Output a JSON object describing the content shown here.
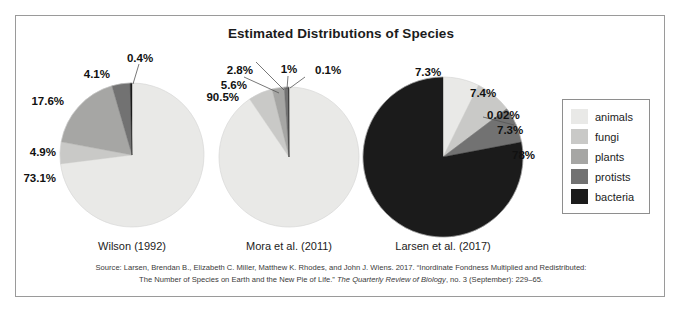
{
  "title": "Estimated Distributions of Species",
  "colors": {
    "animals": "#e9e9e7",
    "fungi": "#c9c9c7",
    "plants": "#a6a6a4",
    "protists": "#727272",
    "bacteria": "#1b1b1b",
    "frame": "#9a9a9a",
    "text": "#1c1c1c"
  },
  "legend": {
    "items": [
      {
        "label": "animals",
        "color": "#e9e9e7"
      },
      {
        "label": "fungi",
        "color": "#c9c9c7"
      },
      {
        "label": "plants",
        "color": "#a6a6a4"
      },
      {
        "label": "protists",
        "color": "#727272"
      },
      {
        "label": "bacteria",
        "color": "#1b1b1b"
      }
    ]
  },
  "source": {
    "line1_a": "Source: Larsen, Brendan B., Elizabeth C. Miller, Matthew K. Rhodes, and John J. Wiens. 2017. “Inordinate Fondness Multiplied and Redistributed:",
    "line2_a": "The Number of Species on Earth and the New Pie of Life.” ",
    "line2_ital": "The Quarterly Review of Biology",
    "line2_b": ", no. 3 (September): 229–65."
  },
  "chart_data": {
    "type": "pie",
    "title": "Estimated Distributions of Species",
    "categories": [
      "animals",
      "fungi",
      "plants",
      "protists",
      "bacteria"
    ],
    "legend_position": "right",
    "charts": [
      {
        "name": "Wilson (1992)",
        "caption": "Wilson (1992)",
        "values": [
          73.1,
          4.9,
          17.6,
          4.1,
          0.4
        ],
        "labels": [
          "73.1%",
          "4.9%",
          "17.6%",
          "4.1%",
          "0.4%"
        ]
      },
      {
        "name": "Mora et al. (2011)",
        "caption": "Mora et al. (2011)",
        "values": [
          90.5,
          5.6,
          2.8,
          1.0,
          0.1
        ],
        "labels": [
          "90.5%",
          "5.6%",
          "2.8%",
          "1%",
          "0.1%"
        ]
      },
      {
        "name": "Larsen et al. (2017)",
        "caption": "Larsen et al. (2017)",
        "values": [
          7.3,
          7.4,
          0.02,
          7.3,
          78.0
        ],
        "labels": [
          "7.3%",
          "7.4%",
          "0.02%",
          "7.3%",
          "78%"
        ]
      }
    ]
  },
  "geometry": {
    "pies": [
      {
        "cx": 132,
        "cy": 155,
        "r": 72,
        "caption_y": 240
      },
      {
        "cx": 289,
        "cy": 157,
        "r": 70,
        "caption_y": 240
      },
      {
        "cx": 443,
        "cy": 157,
        "r": 80,
        "caption_y": 240
      }
    ],
    "label_positions": [
      [
        {
          "x": 56,
          "y": 178,
          "anchor": "anchor-end"
        },
        {
          "x": 56,
          "y": 152,
          "anchor": "anchor-end"
        },
        {
          "x": 64,
          "y": 101,
          "anchor": "anchor-end"
        },
        {
          "x": 110,
          "y": 74,
          "anchor": "anchor-end"
        },
        {
          "x": 140,
          "y": 58,
          "anchor": "anchor-mid"
        }
      ],
      [
        {
          "x": 239,
          "y": 97,
          "anchor": "anchor-end"
        },
        {
          "x": 247,
          "y": 85,
          "anchor": "anchor-end"
        },
        {
          "x": 253,
          "y": 70,
          "anchor": "anchor-end"
        },
        {
          "x": 289,
          "y": 69,
          "anchor": "anchor-mid"
        },
        {
          "x": 315,
          "y": 70,
          "anchor": "anchor-start"
        }
      ],
      [
        {
          "x": 428,
          "y": 72,
          "anchor": "anchor-mid"
        },
        {
          "x": 470,
          "y": 93,
          "anchor": "anchor-start"
        },
        {
          "x": 487,
          "y": 115,
          "anchor": "anchor-start"
        },
        {
          "x": 497,
          "y": 130,
          "anchor": "anchor-start"
        },
        {
          "x": 512,
          "y": 155,
          "anchor": "anchor-start"
        }
      ]
    ],
    "leaders": [
      [
        {
          "x1": 139,
          "y1": 64,
          "x2": 133,
          "y2": 84
        }
      ],
      [
        {
          "x1": 244,
          "y1": 77,
          "x2": 279,
          "y2": 93
        },
        {
          "x1": 256,
          "y1": 62,
          "x2": 284,
          "y2": 90
        },
        {
          "x1": 288,
          "y1": 76,
          "x2": 287,
          "y2": 89
        },
        {
          "x1": 305,
          "y1": 77,
          "x2": 290,
          "y2": 88
        }
      ],
      [
        {
          "x1": 483,
          "y1": 117,
          "x2": 514,
          "y2": 125
        }
      ]
    ]
  }
}
